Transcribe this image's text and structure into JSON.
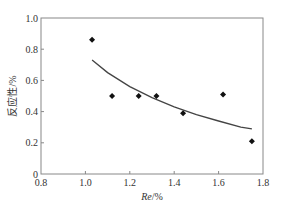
{
  "chart_data": {
    "type": "scatter",
    "title": "",
    "xlabel": "Re/%",
    "xlabel_italic_part": "Re",
    "xlabel_rest": "/%",
    "ylabel": "反应性/%",
    "xlim": [
      0.8,
      1.8
    ],
    "ylim": [
      0,
      1.0
    ],
    "x_ticks": [
      0.8,
      1.0,
      1.2,
      1.4,
      1.6,
      1.8
    ],
    "x_tick_labels": [
      "0.8",
      "1.0",
      "1.2",
      "1.4",
      "1.6",
      "1.8"
    ],
    "y_ticks": [
      0,
      0.2,
      0.4,
      0.6,
      0.8,
      1.0
    ],
    "y_tick_labels": [
      "0",
      "0.2",
      "0.4",
      "0.6",
      "0.8",
      "1.0"
    ],
    "grid": false,
    "legend": null,
    "series": [
      {
        "name": "data",
        "marker": "diamond",
        "color": "#111111",
        "x": [
          1.03,
          1.12,
          1.24,
          1.32,
          1.44,
          1.62,
          1.75
        ],
        "y": [
          0.86,
          0.5,
          0.5,
          0.5,
          0.39,
          0.51,
          0.21
        ]
      },
      {
        "name": "fit",
        "type": "line",
        "color": "#444444",
        "x": [
          1.03,
          1.1,
          1.2,
          1.3,
          1.4,
          1.5,
          1.6,
          1.7,
          1.75
        ],
        "y": [
          0.73,
          0.65,
          0.56,
          0.49,
          0.43,
          0.38,
          0.34,
          0.3,
          0.29
        ]
      }
    ]
  },
  "colors": {
    "axis": "#888888",
    "marker": "#111111",
    "curve": "#444444"
  }
}
